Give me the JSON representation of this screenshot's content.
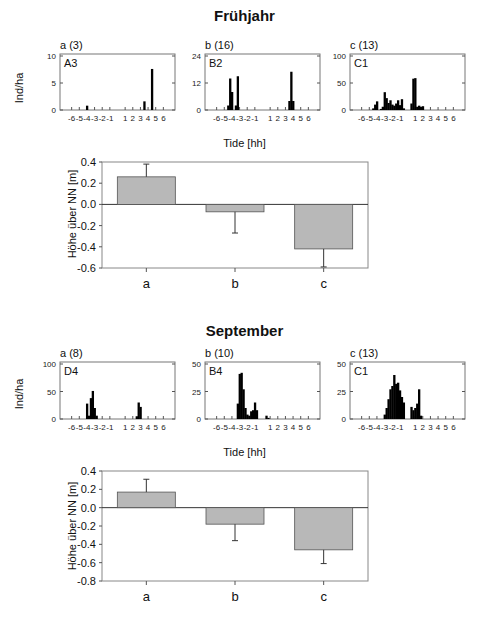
{
  "sections": [
    {
      "title": "Frühjahr",
      "shared_ylabel": "Ind/ha",
      "xlabel": "Tide [hh]",
      "bar_ylabel": "Höhe über NN [m]"
    },
    {
      "title": "September",
      "shared_ylabel": "Ind/ha",
      "xlabel": "Tide [hh]",
      "bar_ylabel": "Höhe über NN [m]"
    }
  ],
  "colors": {
    "bar_fill": "#b8b8b8",
    "hist_fill": "#000000",
    "axis": "#444444"
  },
  "chart_data": [
    {
      "type": "bar",
      "section": "Frühjahr",
      "panel": "a (3)",
      "station": "A3",
      "xlabel": "Tide [hh]",
      "ylabel": "Ind/ha",
      "ylim": [
        0,
        10
      ],
      "yticks": [
        0,
        5,
        10
      ],
      "xticks": [
        -6,
        -5,
        -4,
        -3,
        -2,
        -1,
        1,
        2,
        3,
        4,
        5,
        6
      ],
      "x": [
        -4,
        3.5,
        4.5
      ],
      "values": [
        0.8,
        1.6,
        7.6
      ]
    },
    {
      "type": "bar",
      "section": "Frühjahr",
      "panel": "b (16)",
      "station": "B2",
      "xlabel": "Tide [hh]",
      "ylabel": "Ind/ha",
      "ylim": [
        0,
        24
      ],
      "yticks": [
        0,
        12,
        24
      ],
      "xticks": [
        -6,
        -5,
        -4,
        -3,
        -2,
        -1,
        1,
        2,
        3,
        4,
        5,
        6
      ],
      "x": [
        -4.5,
        -4.25,
        -4.0,
        -3.5,
        -3.25,
        3.5,
        3.75,
        4.0
      ],
      "values": [
        2,
        14,
        8,
        2,
        15,
        4,
        17,
        4
      ]
    },
    {
      "type": "bar",
      "section": "Frühjahr",
      "panel": "c (13)",
      "station": "C1",
      "xlabel": "Tide [hh]",
      "ylabel": "Ind/ha",
      "ylim": [
        0,
        100
      ],
      "yticks": [
        0,
        50,
        100
      ],
      "xticks": [
        -6,
        -5,
        -4,
        -3,
        -2,
        -1,
        1,
        2,
        3,
        4,
        5,
        6
      ],
      "x": [
        -4.5,
        -4.25,
        -4,
        -3.5,
        -3.25,
        -3,
        -2.75,
        -2.5,
        -2.25,
        -2,
        -1.75,
        -1.5,
        -1.25,
        -1,
        -0.75,
        -0.5,
        0.5,
        0.75,
        1,
        1.25,
        1.5,
        1.75,
        2,
        2.25,
        2.5,
        2.75,
        3,
        3.25
      ],
      "values": [
        3,
        10,
        16,
        2,
        6,
        33,
        22,
        13,
        18,
        10,
        8,
        12,
        18,
        9,
        20,
        3,
        12,
        58,
        59,
        6,
        8,
        6,
        7,
        0,
        0,
        0,
        0,
        0
      ]
    },
    {
      "type": "bar",
      "section": "Frühjahr",
      "panel": "elevation",
      "title": "",
      "xlabel": "",
      "ylabel": "Höhe über NN [m]",
      "categories": [
        "a",
        "b",
        "c"
      ],
      "values": [
        0.26,
        -0.07,
        -0.42
      ],
      "errors": [
        0.12,
        0.2,
        0.17
      ],
      "ylim": [
        -0.6,
        0.4
      ],
      "yticks": [
        -0.6,
        -0.4,
        -0.2,
        0.0,
        0.2,
        0.4
      ]
    },
    {
      "type": "bar",
      "section": "September",
      "panel": "a (8)",
      "station": "D4",
      "xlabel": "Tide [hh]",
      "ylabel": "Ind/ha",
      "ylim": [
        0,
        100
      ],
      "yticks": [
        0,
        50,
        100
      ],
      "xticks": [
        -6,
        -5,
        -4,
        -3,
        -2,
        -1,
        1,
        2,
        3,
        4,
        5,
        6
      ],
      "x": [
        -4,
        -3.75,
        -3.5,
        -3.25,
        -3,
        -2.75,
        -2.5,
        2.5,
        2.75,
        3.0
      ],
      "values": [
        28,
        6,
        38,
        51,
        20,
        6,
        0,
        5,
        30,
        22
      ]
    },
    {
      "type": "bar",
      "section": "September",
      "panel": "b (10)",
      "station": "B4",
      "xlabel": "Tide [hh]",
      "ylabel": "Ind/ha",
      "ylim": [
        0,
        50
      ],
      "yticks": [
        0,
        25,
        50
      ],
      "xticks": [
        -6,
        -5,
        -4,
        -3,
        -2,
        -1,
        1,
        2,
        3,
        4,
        5,
        6
      ],
      "x": [
        -3.25,
        -3,
        -2.75,
        -2.5,
        -2.25,
        -2,
        -1.75,
        -1.5,
        -1.25,
        -1,
        -0.75,
        0.5,
        0.75,
        1,
        1.25,
        1.5
      ],
      "values": [
        14,
        41,
        42,
        27,
        10,
        4,
        3,
        7,
        8,
        15,
        8,
        3,
        1,
        0,
        0,
        0
      ]
    },
    {
      "type": "bar",
      "section": "September",
      "panel": "c (13)",
      "station": "C1",
      "xlabel": "Tide [hh]",
      "ylabel": "Ind/ha",
      "ylim": [
        0,
        50
      ],
      "yticks": [
        0,
        25,
        50
      ],
      "xticks": [
        -6,
        -5,
        -4,
        -3,
        -2,
        -1,
        1,
        2,
        3,
        4,
        5,
        6
      ],
      "x": [
        -3,
        -2.75,
        -2.5,
        -2.25,
        -2,
        -1.75,
        -1.5,
        -1.25,
        -1,
        -0.75,
        -0.5,
        0.5,
        0.75,
        1,
        1.25,
        1.5,
        1.75,
        2,
        2.25
      ],
      "values": [
        4,
        10,
        18,
        27,
        30,
        40,
        32,
        33,
        26,
        20,
        15,
        11,
        8,
        10,
        14,
        27,
        3,
        0,
        0
      ]
    },
    {
      "type": "bar",
      "section": "September",
      "panel": "elevation",
      "title": "",
      "xlabel": "",
      "ylabel": "Höhe über NN [m]",
      "categories": [
        "a",
        "b",
        "c"
      ],
      "values": [
        0.17,
        -0.18,
        -0.46
      ],
      "errors": [
        0.14,
        0.18,
        0.15
      ],
      "ylim": [
        -0.8,
        0.4
      ],
      "yticks": [
        -0.8,
        -0.6,
        -0.4,
        -0.2,
        0.0,
        0.2,
        0.4
      ]
    }
  ]
}
